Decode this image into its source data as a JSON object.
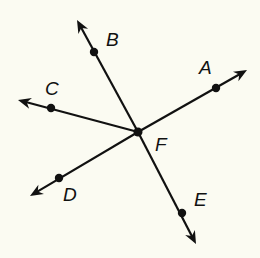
{
  "diagram": {
    "type": "rays-from-point",
    "background": "#fbfbf2",
    "stroke_color": "#111111",
    "center": {
      "label": "F",
      "x": 138,
      "y": 132,
      "label_x": 155,
      "label_y": 135
    },
    "rays": [
      {
        "label": "A",
        "point": {
          "x": 216,
          "y": 88
        },
        "tip": {
          "x": 247,
          "y": 70
        },
        "label_x": 199,
        "label_y": 58
      },
      {
        "label": "B",
        "point": {
          "x": 94,
          "y": 52
        },
        "tip": {
          "x": 77,
          "y": 20
        },
        "label_x": 106,
        "label_y": 30
      },
      {
        "label": "C",
        "point": {
          "x": 51,
          "y": 108
        },
        "tip": {
          "x": 18,
          "y": 100
        },
        "label_x": 45,
        "label_y": 79
      },
      {
        "label": "D",
        "point": {
          "x": 59,
          "y": 178
        },
        "tip": {
          "x": 30,
          "y": 196
        },
        "label_x": 63,
        "label_y": 185
      },
      {
        "label": "E",
        "point": {
          "x": 182,
          "y": 213
        },
        "tip": {
          "x": 196,
          "y": 244
        },
        "label_x": 194,
        "label_y": 190
      }
    ]
  }
}
